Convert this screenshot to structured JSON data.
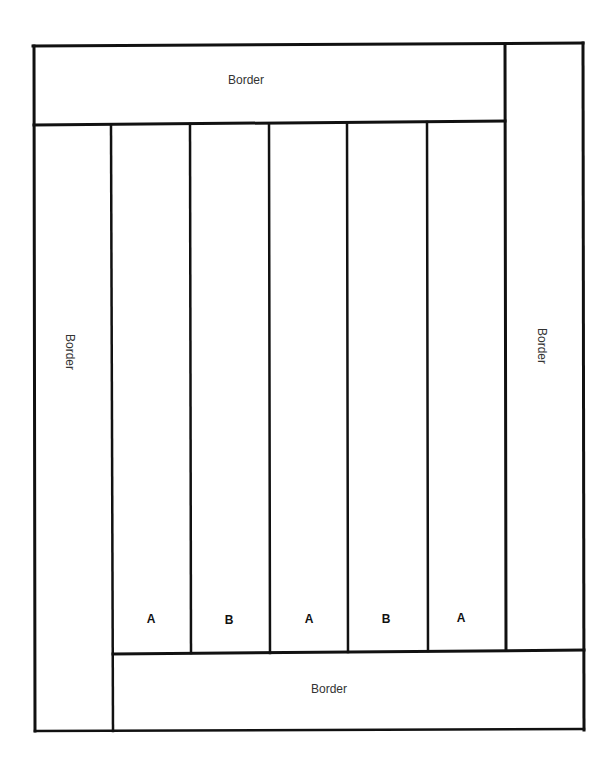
{
  "diagram": {
    "type": "quilt-layout",
    "borders": {
      "top": {
        "label": "Border"
      },
      "left": {
        "label": "Border"
      },
      "right": {
        "label": "Border"
      },
      "bottom": {
        "label": "Border"
      }
    },
    "columns": [
      {
        "label": "A"
      },
      {
        "label": "B"
      },
      {
        "label": "A"
      },
      {
        "label": "B"
      },
      {
        "label": "A"
      }
    ],
    "line_color": "#111111",
    "background": "#ffffff"
  }
}
